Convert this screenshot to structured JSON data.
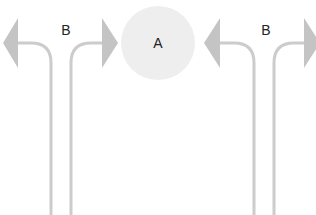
{
  "diagram": {
    "center_node": {
      "label": "A",
      "cx": 158,
      "cy": 43,
      "r": 37,
      "fill": "#eeeeee"
    },
    "groups": [
      {
        "label": "B",
        "label_x": 66,
        "label_y": 30,
        "left_line_x": 51,
        "right_line_x": 71,
        "left_arrow": {
          "tip_x": 3,
          "base_x": 18,
          "y": 43,
          "half_h": 25
        },
        "right_arrow": {
          "tip_x": 118,
          "base_x": 102,
          "y": 43,
          "half_h": 25
        }
      },
      {
        "label": "B",
        "label_x": 266,
        "label_y": 30,
        "left_line_x": 254,
        "right_line_x": 274,
        "left_arrow": {
          "tip_x": 204,
          "base_x": 220,
          "y": 43,
          "half_h": 25
        },
        "right_arrow": {
          "tip_x": 320,
          "base_x": 304,
          "y": 43,
          "half_h": 25
        }
      }
    ],
    "colors": {
      "line": "#cccccc",
      "arrow": "#c4c4c4",
      "text": "#222222",
      "background": "#ffffff"
    },
    "line_width": 3,
    "bottom_y": 215
  }
}
